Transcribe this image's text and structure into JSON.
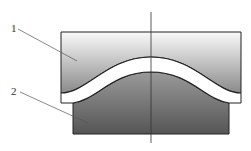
{
  "diagram": {
    "type": "cross-section",
    "parts": [
      {
        "id": "1",
        "label": "1",
        "description": "upper block with convex curved cavity"
      },
      {
        "id": "2",
        "label": "2",
        "description": "lower block with convex curved top"
      }
    ],
    "centerline": true,
    "colors": {
      "outline": "#222222",
      "upper_gradient_top": "#fafafa",
      "upper_gradient_bottom": "#8a8a8a",
      "lower_gradient_top": "#9a9a9a",
      "lower_gradient_bottom": "#555555",
      "gap": "#ffffff",
      "leader": "#555555"
    }
  }
}
